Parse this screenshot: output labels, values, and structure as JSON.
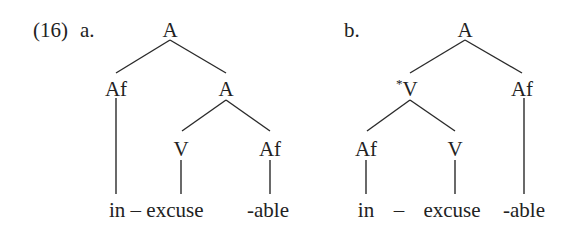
{
  "example": {
    "number": "(16)",
    "trees": [
      {
        "label": "a.",
        "nodes": {
          "root": "A",
          "left": "Af",
          "right": "A",
          "right_left": "V",
          "right_right": "Af"
        },
        "leaves": {
          "prefix_stem": "in – excuse",
          "suffix": "-able"
        }
      },
      {
        "label": "b.",
        "nodes": {
          "root": "A",
          "left_star": "*",
          "left": "V",
          "right": "Af",
          "left_left": "Af",
          "left_right": "V"
        },
        "leaves": {
          "prefix": "in",
          "dash": "–",
          "stem": "excuse",
          "suffix": "-able"
        }
      }
    ]
  }
}
